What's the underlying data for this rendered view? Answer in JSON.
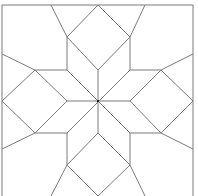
{
  "diagram": {
    "stroke_color": "#7a7a7a",
    "background_color": "#ffffff",
    "border": {
      "x": 2,
      "y": 5,
      "width": 191,
      "height": 196
    },
    "center": {
      "x": 98,
      "y": 101
    },
    "lines": [
      [
        2,
        54,
        35,
        70
      ],
      [
        2,
        149,
        35,
        133
      ],
      [
        193,
        54,
        161,
        70
      ],
      [
        193,
        149,
        161,
        133
      ],
      [
        51,
        5,
        67,
        37
      ],
      [
        145,
        5,
        130,
        37
      ],
      [
        51,
        196,
        67,
        165
      ],
      [
        145,
        196,
        130,
        165
      ],
      [
        35,
        70,
        67,
        70
      ],
      [
        35,
        133,
        67,
        133
      ],
      [
        130,
        70,
        161,
        70
      ],
      [
        130,
        133,
        161,
        133
      ],
      [
        67,
        37,
        67,
        70
      ],
      [
        130,
        37,
        130,
        70
      ],
      [
        67,
        133,
        67,
        165
      ],
      [
        130,
        133,
        130,
        165
      ],
      [
        98,
        5,
        67,
        37
      ],
      [
        98,
        5,
        130,
        37
      ],
      [
        67,
        37,
        98,
        70
      ],
      [
        130,
        37,
        98,
        70
      ],
      [
        98,
        196,
        67,
        165
      ],
      [
        98,
        196,
        130,
        165
      ],
      [
        67,
        165,
        98,
        133
      ],
      [
        130,
        165,
        98,
        133
      ],
      [
        2,
        101,
        35,
        70
      ],
      [
        2,
        101,
        35,
        133
      ],
      [
        35,
        70,
        67,
        101
      ],
      [
        35,
        133,
        67,
        101
      ],
      [
        193,
        101,
        161,
        70
      ],
      [
        193,
        101,
        161,
        133
      ],
      [
        161,
        70,
        130,
        101
      ],
      [
        161,
        133,
        130,
        101
      ],
      [
        98,
        70,
        98,
        133
      ],
      [
        67,
        101,
        130,
        101
      ],
      [
        67,
        70,
        130,
        133
      ],
      [
        130,
        70,
        67,
        133
      ]
    ]
  }
}
